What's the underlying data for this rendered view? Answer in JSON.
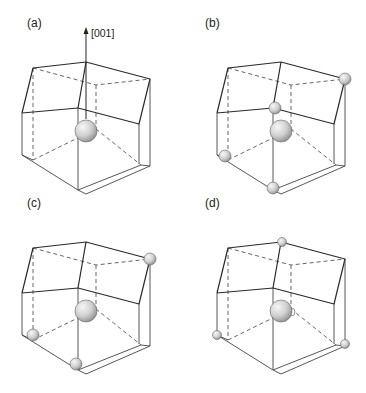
{
  "figure": {
    "title": "",
    "axis_label": "[001]",
    "colors": {
      "line": "#2a2a2a",
      "dash": "#555555",
      "sphere_light": "#f4f4f4",
      "sphere_dark": "#8c8c8c",
      "sphere_stroke": "#666666"
    },
    "panels": [
      {
        "id": "a",
        "label": "(a)",
        "offset": [
          0,
          0
        ],
        "show_axis": true,
        "central_sphere": {
          "x": 86,
          "y": 131,
          "r": 11
        },
        "small_spheres": []
      },
      {
        "id": "b",
        "label": "(b)",
        "offset": [
          195,
          0
        ],
        "show_axis": false,
        "central_sphere": {
          "x": 86,
          "y": 131,
          "r": 11
        },
        "small_spheres": [
          {
            "x": 80,
            "y": 108,
            "r": 6
          },
          {
            "x": 150,
            "y": 79,
            "r": 6
          },
          {
            "x": 30,
            "y": 156,
            "r": 6
          },
          {
            "x": 78,
            "y": 188,
            "r": 6
          }
        ]
      },
      {
        "id": "c",
        "label": "(c)",
        "offset": [
          0,
          180
        ],
        "show_axis": false,
        "central_sphere": {
          "x": 86,
          "y": 131,
          "r": 11
        },
        "small_spheres": [
          {
            "x": 150,
            "y": 79,
            "r": 6
          },
          {
            "x": 33,
            "y": 155,
            "r": 6
          },
          {
            "x": 76,
            "y": 184,
            "r": 6
          }
        ]
      },
      {
        "id": "d",
        "label": "(d)",
        "offset": [
          195,
          180
        ],
        "show_axis": false,
        "central_sphere": {
          "x": 86,
          "y": 131,
          "r": 11
        },
        "satellite_sphere": {
          "x": 96,
          "y": 132,
          "r": 4
        },
        "small_spheres": [
          {
            "x": 87,
            "y": 62,
            "r": 4.5
          },
          {
            "x": 22,
            "y": 155,
            "r": 4.5
          },
          {
            "x": 150,
            "y": 164,
            "r": 4.5
          }
        ]
      }
    ]
  }
}
